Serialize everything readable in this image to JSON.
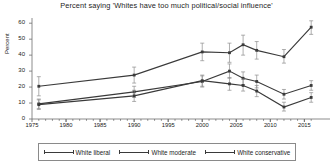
{
  "chart_data": {
    "type": "line",
    "title": "Percent saying 'Whites have too much political/social influence'",
    "xlabel": "",
    "ylabel": "Percent",
    "xlim": [
      1975,
      2017
    ],
    "ylim": [
      0,
      62
    ],
    "yticks": [
      0,
      10,
      20,
      30,
      40,
      50,
      60
    ],
    "xticks": [
      1975,
      1980,
      1985,
      1990,
      1995,
      2000,
      2005,
      2010,
      2015
    ],
    "grid": false,
    "legend_position": "bottom",
    "error_bars": true,
    "series": [
      {
        "name": "White liberal",
        "x": [
          1976,
          1990,
          2000,
          2004,
          2006,
          2008,
          2012,
          2016
        ],
        "values": [
          20.5,
          27.5,
          42.0,
          41.5,
          46.5,
          43.0,
          39.0,
          57.5
        ],
        "err_low": [
          14.5,
          22.5,
          36.5,
          35.5,
          40.0,
          37.5,
          35.0,
          53.0
        ],
        "err_high": [
          26.5,
          32.5,
          47.5,
          47.5,
          52.5,
          48.5,
          43.5,
          61.5
        ]
      },
      {
        "name": "White moderate",
        "x": [
          1976,
          1990,
          2000,
          2004,
          2006,
          2008,
          2012,
          2016
        ],
        "values": [
          9.5,
          17.0,
          23.5,
          30.0,
          25.5,
          23.5,
          15.5,
          21.0
        ],
        "err_low": [
          6.5,
          13.5,
          20.0,
          25.5,
          21.5,
          19.5,
          12.5,
          18.0
        ],
        "err_high": [
          12.5,
          20.5,
          27.0,
          34.5,
          29.5,
          27.5,
          18.5,
          24.0
        ]
      },
      {
        "name": "White conservative",
        "x": [
          1976,
          1990,
          2000,
          2004,
          2006,
          2008,
          2012,
          2016
        ],
        "values": [
          9.0,
          14.5,
          24.0,
          22.0,
          21.0,
          17.5,
          7.5,
          13.5
        ],
        "err_low": [
          6.0,
          11.0,
          20.5,
          18.0,
          17.5,
          14.0,
          5.0,
          10.5
        ],
        "err_high": [
          12.0,
          18.0,
          27.5,
          26.0,
          25.0,
          21.0,
          10.5,
          16.5
        ]
      }
    ]
  },
  "legend": {
    "items": [
      {
        "label": "White liberal"
      },
      {
        "label": "White moderate"
      },
      {
        "label": "White conservative"
      }
    ]
  },
  "colors": {
    "line": "#3a3a3a",
    "axis": "#6f6f6f",
    "text": "#1c1c1c"
  }
}
